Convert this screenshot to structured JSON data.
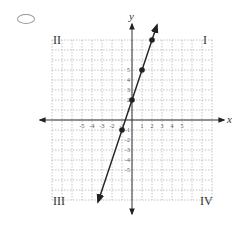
{
  "answer_option": {
    "selected": false
  },
  "chart_data": {
    "type": "line",
    "title": "",
    "xlabel": "x",
    "ylabel": "y",
    "xlim": [
      -8,
      8
    ],
    "ylim": [
      -8,
      8
    ],
    "grid": true,
    "x_tick_labels": [
      "-5",
      "-4",
      "-3",
      "-2",
      "-1",
      "1",
      "2",
      "3",
      "4",
      "5"
    ],
    "y_tick_labels": [
      "5",
      "4",
      "3",
      "2",
      "1",
      "-1",
      "-2",
      "-3",
      "-4",
      "-5"
    ],
    "quadrant_labels": {
      "q1": "I",
      "q2": "II",
      "q3": "III",
      "q4": "IV"
    },
    "series": [
      {
        "name": "line",
        "equation": "y = 3x + 2",
        "points": [
          {
            "x": -1,
            "y": -1
          },
          {
            "x": 0,
            "y": 2
          },
          {
            "x": 1,
            "y": 5
          },
          {
            "x": 2,
            "y": 8
          }
        ],
        "arrows_both_ends": true
      }
    ]
  }
}
